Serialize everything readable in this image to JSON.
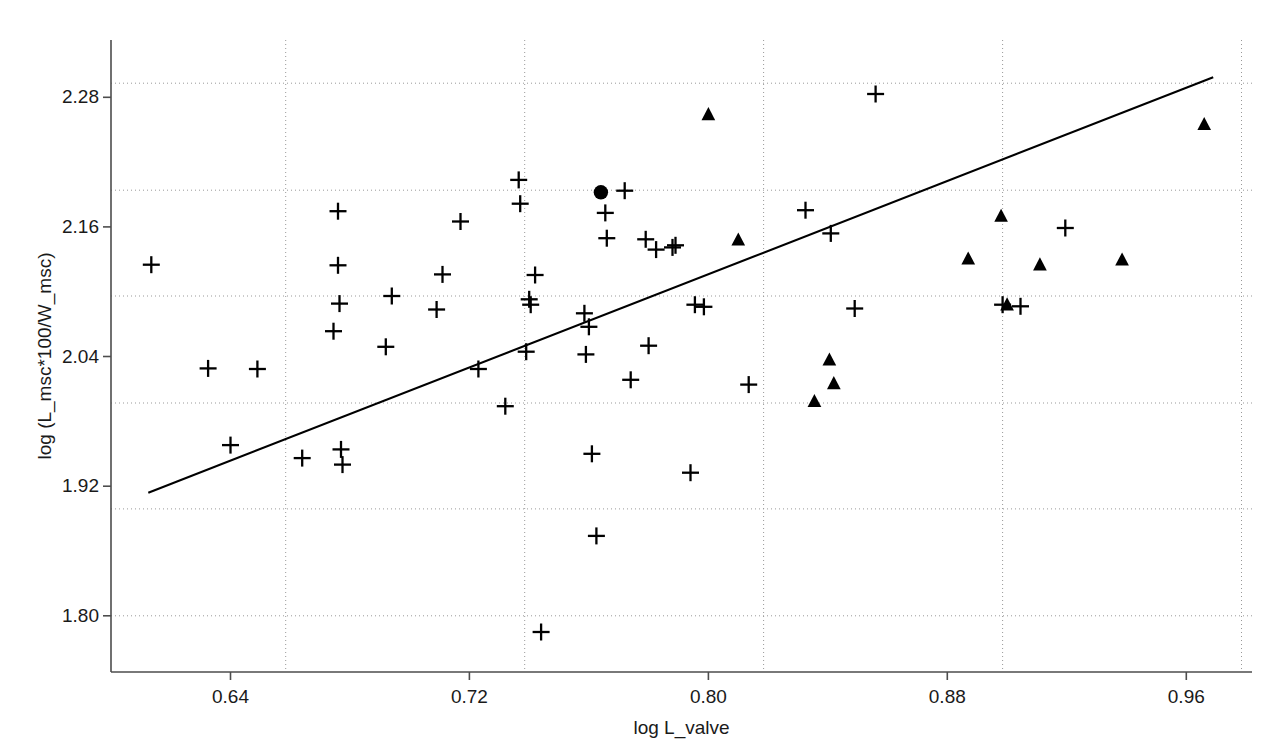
{
  "chart_data": {
    "type": "scatter",
    "title": "",
    "xlabel": "log L_valve",
    "ylabel": "log (L_msc*100/W_msc)",
    "xlim": [
      0.6,
      0.982
    ],
    "ylim": [
      1.748,
      2.333
    ],
    "xticks": [
      0.64,
      0.72,
      0.8,
      0.88,
      0.96
    ],
    "xtick_labels": [
      "0.64",
      "0.72",
      "0.80",
      "0.88",
      "0.96"
    ],
    "yticks": [
      1.8,
      1.92,
      2.04,
      2.16,
      2.28
    ],
    "ytick_labels": [
      "1.80",
      "1.92",
      "2.04",
      "2.16",
      "2.28"
    ],
    "grid": true,
    "grid_style": "dotted",
    "grid_color": "#999999",
    "grid_x": [
      0.6585,
      0.7385,
      0.8185,
      0.8985,
      0.9785
    ],
    "grid_y": [
      1.8,
      1.899,
      1.997,
      2.096,
      2.194,
      2.293
    ],
    "legend": null,
    "marker_color": "#000000",
    "line_color": "#000000",
    "series": [
      {
        "name": "cross",
        "marker": "plus",
        "count": 53,
        "points": [
          [
            0.6135,
            2.125
          ],
          [
            0.6325,
            2.029
          ],
          [
            0.64,
            1.958
          ],
          [
            0.649,
            2.0285
          ],
          [
            0.664,
            1.946
          ],
          [
            0.6745,
            2.0635
          ],
          [
            0.676,
            2.1745
          ],
          [
            0.676,
            2.1245
          ],
          [
            0.6765,
            2.089
          ],
          [
            0.677,
            1.954
          ],
          [
            0.6775,
            1.94
          ],
          [
            0.692,
            2.049
          ],
          [
            0.694,
            2.096
          ],
          [
            0.709,
            2.0835
          ],
          [
            0.711,
            2.116
          ],
          [
            0.717,
            2.165
          ],
          [
            0.723,
            2.0285
          ],
          [
            0.732,
            1.994
          ],
          [
            0.7365,
            2.2035
          ],
          [
            0.737,
            2.1815
          ],
          [
            0.739,
            2.0445
          ],
          [
            0.74,
            2.093
          ],
          [
            0.7405,
            2.088
          ],
          [
            0.742,
            2.1155
          ],
          [
            0.744,
            1.785
          ],
          [
            0.7585,
            2.08
          ],
          [
            0.759,
            2.042
          ],
          [
            0.76,
            2.0675
          ],
          [
            0.761,
            1.95
          ],
          [
            0.7625,
            1.874
          ],
          [
            0.7655,
            2.173
          ],
          [
            0.766,
            2.1495
          ],
          [
            0.772,
            2.1935
          ],
          [
            0.774,
            2.0185
          ],
          [
            0.779,
            2.1485
          ],
          [
            0.78,
            2.05
          ],
          [
            0.7825,
            2.139
          ],
          [
            0.788,
            2.141
          ],
          [
            0.789,
            2.143
          ],
          [
            0.794,
            1.9325
          ],
          [
            0.7955,
            2.088
          ],
          [
            0.7985,
            2.086
          ],
          [
            0.8135,
            2.014
          ],
          [
            0.8325,
            2.1755
          ],
          [
            0.841,
            2.154
          ],
          [
            0.849,
            2.0845
          ],
          [
            0.856,
            2.283
          ],
          [
            0.8985,
            2.088
          ],
          [
            0.9045,
            2.0865
          ],
          [
            0.9195,
            2.159
          ]
        ]
      },
      {
        "name": "triangle",
        "marker": "triangle-up",
        "count": 12,
        "points": [
          [
            0.8,
            2.264
          ],
          [
            0.81,
            2.148
          ],
          [
            0.8405,
            2.037
          ],
          [
            0.842,
            2.015
          ],
          [
            0.8355,
            1.9985
          ],
          [
            0.887,
            2.1305
          ],
          [
            0.898,
            2.17
          ],
          [
            0.9,
            2.088
          ],
          [
            0.911,
            2.125
          ],
          [
            0.9385,
            2.1295
          ],
          [
            0.966,
            2.255
          ]
        ]
      },
      {
        "name": "filled-circle",
        "marker": "circle",
        "count": 1,
        "points": [
          [
            0.764,
            2.192
          ]
        ]
      }
    ],
    "fit_line": {
      "name": "regression-line",
      "x0": 0.6125,
      "y0": 1.914,
      "x1": 0.969,
      "y1": 2.2985
    }
  },
  "axes": {
    "x_title": "log L_valve",
    "y_title": "log (L_msc*100/W_msc)"
  }
}
